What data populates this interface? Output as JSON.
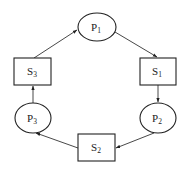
{
  "diagram": {
    "type": "cycle",
    "nodes": [
      {
        "id": "P1",
        "kind": "process",
        "shape": "ellipse",
        "label_main": "P",
        "label_sub": "1",
        "cx": 97,
        "cy": 27,
        "rx": 19,
        "ry": 14
      },
      {
        "id": "S1",
        "kind": "resource",
        "shape": "rect",
        "label_main": "S",
        "label_sub": "1",
        "x": 140,
        "y": 58,
        "w": 36,
        "h": 27
      },
      {
        "id": "P2",
        "kind": "process",
        "shape": "ellipse",
        "label_main": "P",
        "label_sub": "2",
        "cx": 158,
        "cy": 118,
        "rx": 18,
        "ry": 15
      },
      {
        "id": "S2",
        "kind": "resource",
        "shape": "rect",
        "label_main": "S",
        "label_sub": "2",
        "x": 78,
        "y": 134,
        "w": 37,
        "h": 27
      },
      {
        "id": "P3",
        "kind": "process",
        "shape": "ellipse",
        "label_main": "P",
        "label_sub": "3",
        "cx": 33,
        "cy": 118,
        "rx": 18,
        "ry": 15
      },
      {
        "id": "S3",
        "kind": "resource",
        "shape": "rect",
        "label_main": "S",
        "label_sub": "3",
        "x": 14,
        "y": 58,
        "w": 37,
        "h": 27
      }
    ],
    "edges": [
      {
        "from": "P1",
        "to": "S1"
      },
      {
        "from": "S1",
        "to": "P2"
      },
      {
        "from": "P2",
        "to": "S2"
      },
      {
        "from": "S2",
        "to": "P3"
      },
      {
        "from": "P3",
        "to": "S3"
      },
      {
        "from": "S3",
        "to": "P1"
      }
    ],
    "colors": {
      "stroke": "#222222",
      "background": "#ffffff"
    }
  }
}
